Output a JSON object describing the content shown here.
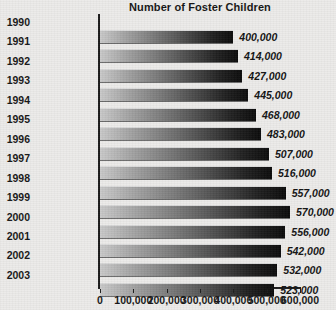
{
  "chart_data": {
    "type": "bar",
    "orientation": "horizontal",
    "title": "Number of Foster Children",
    "xlabel": "",
    "ylabel": "",
    "xlim": [
      0,
      600000
    ],
    "grid": false,
    "legend": null,
    "xticks": [
      "0",
      "100,000",
      "200,000",
      "300,000",
      "400,000",
      "500,000",
      "600,000"
    ],
    "xtick_values": [
      0,
      100000,
      200000,
      300000,
      400000,
      500000,
      600000
    ],
    "categories": [
      "1990",
      "1991",
      "1992",
      "1993",
      "1994",
      "1995",
      "1996",
      "1997",
      "1998",
      "1999",
      "2000",
      "2001",
      "2002",
      "2003"
    ],
    "values": [
      400000,
      414000,
      427000,
      445000,
      468000,
      483000,
      507000,
      516000,
      557000,
      570000,
      556000,
      542000,
      532000,
      523000
    ],
    "value_labels": [
      "400,000",
      "414,000",
      "427,000",
      "445,000",
      "468,000",
      "483,000",
      "507,000",
      "516,000",
      "557,000",
      "570,000",
      "556,000",
      "542,000",
      "532,000",
      "523,000"
    ]
  },
  "style": {
    "background": "#ecebe9",
    "axis_color": "#1b1b1b",
    "bar_gradient_start": "#c9c9c9",
    "bar_gradient_end": "#0a0a0a",
    "text_color": "#151515"
  }
}
